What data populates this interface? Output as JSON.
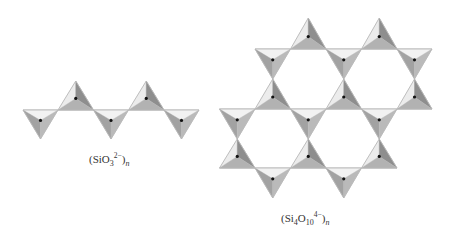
{
  "figure": {
    "chain": {
      "label": {
        "open": "(SiO",
        "sub": "3",
        "sup": "2−",
        "close": ")",
        "n": "n"
      },
      "line_y": 110,
      "line_x": [
        23,
        199
      ],
      "up_apex_y": 81,
      "down_apex_y": 139,
      "down_bases": [
        [
          23,
          58
        ],
        [
          93.5,
          128.5
        ],
        [
          164,
          199
        ]
      ],
      "up_bases": [
        [
          58,
          93.5
        ],
        [
          128.5,
          164
        ]
      ]
    },
    "sheet": {
      "label": {
        "open": "(Si",
        "sub1": "4",
        "mid": "O",
        "sub2": "10",
        "sup": "4−",
        "close": ")",
        "n": "n"
      },
      "rows": [
        {
          "line_y": 49,
          "x": [
            255,
            432
          ],
          "up_apex_y": 18,
          "down_apex_y": 79,
          "up_bases": [
            [
              290.5,
              326
            ],
            [
              361.5,
              397
            ]
          ],
          "down_bases": [
            [
              255,
              290.5
            ],
            [
              326,
              361.5
            ],
            [
              397,
              432
            ]
          ]
        },
        {
          "line_y": 109,
          "x": [
            219.5,
            432
          ],
          "up_apex_y": 79,
          "down_apex_y": 139,
          "up_bases": [
            [
              255,
              290.5
            ],
            [
              326,
              361.5
            ],
            [
              397,
              432
            ]
          ],
          "down_bases": [
            [
              219.5,
              255
            ],
            [
              290.5,
              326
            ],
            [
              361.5,
              397
            ]
          ]
        },
        {
          "line_y": 168,
          "x": [
            219.5,
            397
          ],
          "up_apex_y": 139,
          "down_apex_y": 198,
          "up_bases": [
            [
              219.5,
              255
            ],
            [
              290.5,
              326
            ],
            [
              361.5,
              397
            ]
          ],
          "down_bases": [
            [
              255,
              290.5
            ],
            [
              326,
              361.5
            ]
          ]
        }
      ]
    },
    "colors": {
      "up_left": "#ececec",
      "up_right": "#8e8e8e",
      "up_bottom": "#b2b2b2",
      "down_top": "#f2f2f2",
      "down_left": "#a2a2a2",
      "down_right": "#bababa",
      "outline": "#b8b8b8",
      "dot": "#111111"
    }
  }
}
